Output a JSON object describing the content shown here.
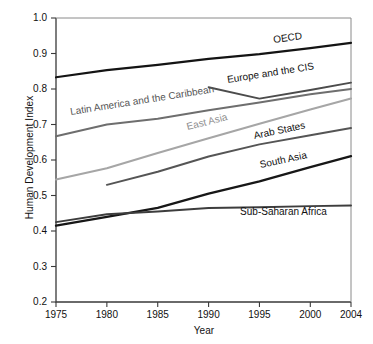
{
  "chart_data": {
    "type": "line",
    "title": "",
    "xlabel": "Year",
    "ylabel": "Human Development Index",
    "xlim": [
      1975,
      2004
    ],
    "ylim": [
      0.2,
      1.0
    ],
    "grid": false,
    "legend_position": "inline-labels",
    "xticks": [
      "1975",
      "1980",
      "1985",
      "1990",
      "1995",
      "2000",
      "2004"
    ],
    "xtick_values": [
      1975,
      1980,
      1985,
      1990,
      1995,
      2000,
      2004
    ],
    "yticks": [
      "0.2",
      "0.3",
      "0.4",
      "0.5",
      "0.6",
      "0.7",
      "0.8",
      "0.9",
      "1.0"
    ],
    "ytick_values": [
      0.2,
      0.3,
      0.4,
      0.5,
      0.6,
      0.7,
      0.8,
      0.9,
      1.0
    ],
    "series": [
      {
        "name": "OECD",
        "color": "#141414",
        "width": 2.2,
        "x": [
          1975,
          1980,
          1985,
          1990,
          1995,
          2000,
          2004
        ],
        "values": [
          0.833,
          0.853,
          0.868,
          0.885,
          0.898,
          0.915,
          0.93
        ]
      },
      {
        "name": "Europe and the CIS",
        "color": "#4c4c4c",
        "width": 1.9,
        "x": [
          1990,
          1995,
          2000,
          2004
        ],
        "values": [
          0.805,
          0.773,
          0.797,
          0.818
        ]
      },
      {
        "name": "Latin America and the Caribbean",
        "color": "#6e6e6e",
        "width": 2.0,
        "x": [
          1975,
          1980,
          1985,
          1990,
          1995,
          2000,
          2004
        ],
        "values": [
          0.667,
          0.7,
          0.716,
          0.74,
          0.762,
          0.785,
          0.8
        ]
      },
      {
        "name": "East Asia",
        "color": "#a6a6a6",
        "width": 2.1,
        "x": [
          1975,
          1980,
          1985,
          1990,
          1995,
          2000,
          2004
        ],
        "values": [
          0.545,
          0.577,
          0.62,
          0.661,
          0.702,
          0.742,
          0.773
        ]
      },
      {
        "name": "Arab States",
        "color": "#555555",
        "width": 2.0,
        "x": [
          1980,
          1985,
          1990,
          1995,
          2000,
          2004
        ],
        "values": [
          0.53,
          0.567,
          0.61,
          0.644,
          0.67,
          0.69
        ]
      },
      {
        "name": "South Asia",
        "color": "#171717",
        "width": 2.3,
        "x": [
          1975,
          1980,
          1985,
          1990,
          1995,
          2000,
          2004
        ],
        "values": [
          0.415,
          0.44,
          0.465,
          0.505,
          0.54,
          0.58,
          0.611
        ]
      },
      {
        "name": "Sub-Saharan Africa",
        "color": "#3d3d3d",
        "width": 1.9,
        "x": [
          1975,
          1980,
          1985,
          1990,
          1995,
          2000,
          2004
        ],
        "values": [
          0.425,
          0.447,
          0.455,
          0.465,
          0.467,
          0.47,
          0.472
        ]
      }
    ],
    "annotations": [
      {
        "text": "OECD",
        "x": 1996.4,
        "y": 0.923,
        "rotation": -8,
        "color": "#111111"
      },
      {
        "text": "Europe and the CIS",
        "x": 1991.9,
        "y": 0.812,
        "rotation": -9,
        "color": "#111111"
      },
      {
        "text": "Latin America and the Caribbean",
        "x": 1976.5,
        "y": 0.72,
        "rotation": -9,
        "color": "#555555"
      },
      {
        "text": "East Asia",
        "x": 1988.0,
        "y": 0.679,
        "rotation": -14,
        "color": "#8d8d8d"
      },
      {
        "text": "Arab States",
        "x": 1994.6,
        "y": 0.654,
        "rotation": -12,
        "color": "#111111"
      },
      {
        "text": "South Asia",
        "x": 1995.2,
        "y": 0.572,
        "rotation": -12,
        "color": "#111111"
      },
      {
        "text": "Sub-Saharan Africa",
        "x": 1993.1,
        "y": 0.44,
        "rotation": 0,
        "color": "#111111"
      }
    ]
  }
}
